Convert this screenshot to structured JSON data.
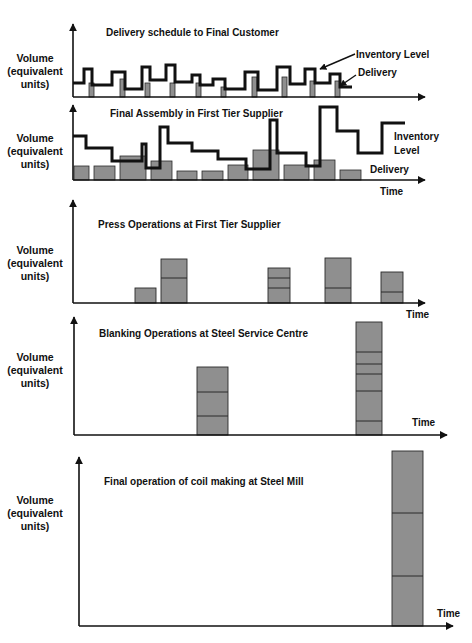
{
  "figure": {
    "axis_label_lines": [
      "Volume",
      "(equivalent",
      "units)"
    ],
    "time_label": "Time",
    "colors": {
      "bar_fill": "#8f8f8f",
      "bar_stroke": "#2a2a2a",
      "line": "#111111",
      "axis": "#111111"
    }
  },
  "chart_data": [
    {
      "type": "bar+line",
      "title": "Delivery schedule to Final Customer",
      "ylabel": "Volume (equivalent units)",
      "xlabel": "",
      "legend": [
        "Inventory Level",
        "Delivery"
      ],
      "annotations": [
        "Inventory Level",
        "Delivery"
      ],
      "layout": {
        "axis_x": 73,
        "axis_top": 22,
        "baseline": 97,
        "axis_right": 425,
        "title_x": 106,
        "title_y": 36
      },
      "delivery_bars": [
        {
          "x": 89,
          "w": 5,
          "top": 83
        },
        {
          "x": 120,
          "w": 5,
          "top": 79
        },
        {
          "x": 145,
          "w": 5,
          "top": 83
        },
        {
          "x": 170,
          "w": 5,
          "top": 83
        },
        {
          "x": 196,
          "w": 5,
          "top": 83
        },
        {
          "x": 221,
          "w": 5,
          "top": 87
        },
        {
          "x": 252,
          "w": 5,
          "top": 77
        },
        {
          "x": 282,
          "w": 5,
          "top": 77
        },
        {
          "x": 310,
          "w": 5,
          "top": 81
        },
        {
          "x": 335,
          "w": 5,
          "top": 81
        }
      ],
      "inventory_line": [
        [
          73,
          83
        ],
        [
          84,
          83
        ],
        [
          84,
          69
        ],
        [
          92,
          69
        ],
        [
          92,
          85
        ],
        [
          112,
          85
        ],
        [
          112,
          72
        ],
        [
          125,
          72
        ],
        [
          125,
          89
        ],
        [
          142,
          89
        ],
        [
          142,
          67
        ],
        [
          150,
          67
        ],
        [
          150,
          80
        ],
        [
          166,
          80
        ],
        [
          166,
          65
        ],
        [
          175,
          65
        ],
        [
          175,
          82
        ],
        [
          192,
          82
        ],
        [
          192,
          75
        ],
        [
          200,
          75
        ],
        [
          200,
          85
        ],
        [
          213,
          85
        ],
        [
          213,
          79
        ],
        [
          225,
          79
        ],
        [
          225,
          89
        ],
        [
          245,
          89
        ],
        [
          245,
          72
        ],
        [
          258,
          72
        ],
        [
          258,
          90
        ],
        [
          277,
          90
        ],
        [
          277,
          67
        ],
        [
          290,
          67
        ],
        [
          290,
          84
        ],
        [
          305,
          84
        ],
        [
          305,
          69
        ],
        [
          315,
          69
        ],
        [
          315,
          83
        ],
        [
          330,
          83
        ],
        [
          330,
          74
        ],
        [
          340,
          74
        ],
        [
          340,
          87
        ],
        [
          352,
          87
        ]
      ],
      "arrows": [
        {
          "label": "Inventory Level",
          "text_x": 356,
          "text_y": 58,
          "from": [
            355,
            54
          ],
          "to": [
            320,
            69
          ]
        },
        {
          "label": "Delivery",
          "text_x": 358,
          "text_y": 76,
          "from": [
            356,
            75
          ],
          "to": [
            340,
            86
          ]
        }
      ]
    },
    {
      "type": "bar+line",
      "title": "Final Assembly in First Tier Supplier",
      "ylabel": "Volume (equivalent units)",
      "xlabel": "Time",
      "legend": [
        "Inventory Level",
        "Delivery"
      ],
      "layout": {
        "axis_x": 73,
        "axis_top": 103,
        "baseline": 180,
        "axis_right": 425,
        "title_x": 110,
        "title_y": 117,
        "time_x": 380,
        "time_y": 195
      },
      "delivery_bars": [
        {
          "x": 74,
          "w": 15,
          "top": 166
        },
        {
          "x": 94,
          "w": 21,
          "top": 166
        },
        {
          "x": 120,
          "w": 26,
          "top": 156
        },
        {
          "x": 151,
          "w": 21,
          "top": 161
        },
        {
          "x": 177,
          "w": 20,
          "top": 171
        },
        {
          "x": 202,
          "w": 21,
          "top": 171
        },
        {
          "x": 228,
          "w": 20,
          "top": 165
        },
        {
          "x": 253,
          "w": 26,
          "top": 150
        },
        {
          "x": 284,
          "w": 25,
          "top": 165
        },
        {
          "x": 314,
          "w": 21,
          "top": 160
        },
        {
          "x": 340,
          "w": 21,
          "top": 170
        }
      ],
      "inventory_line": [
        [
          73,
          136
        ],
        [
          86,
          136
        ],
        [
          86,
          148
        ],
        [
          112,
          148
        ],
        [
          112,
          161
        ],
        [
          142,
          161
        ],
        [
          142,
          144
        ],
        [
          146,
          144
        ],
        [
          146,
          168
        ],
        [
          160,
          168
        ],
        [
          160,
          127
        ],
        [
          168,
          127
        ],
        [
          168,
          143
        ],
        [
          192,
          143
        ],
        [
          192,
          151
        ],
        [
          218,
          151
        ],
        [
          218,
          159
        ],
        [
          246,
          159
        ],
        [
          246,
          169
        ],
        [
          270,
          169
        ],
        [
          270,
          120
        ],
        [
          277,
          120
        ],
        [
          277,
          153
        ],
        [
          306,
          153
        ],
        [
          306,
          166
        ],
        [
          320,
          166
        ],
        [
          320,
          107
        ],
        [
          337,
          107
        ],
        [
          337,
          131
        ],
        [
          358,
          131
        ],
        [
          358,
          153
        ],
        [
          382,
          153
        ],
        [
          382,
          123
        ],
        [
          405,
          123
        ]
      ],
      "right_labels": [
        {
          "text": "Inventory",
          "x": 394,
          "y": 140
        },
        {
          "text": "Level",
          "x": 394,
          "y": 154
        },
        {
          "text": "Delivery",
          "x": 370,
          "y": 173
        }
      ]
    },
    {
      "type": "stacked-bar",
      "title": "Press Operations at First Tier Supplier",
      "ylabel": "Volume (equivalent units)",
      "xlabel": "Time",
      "layout": {
        "axis_x": 73,
        "axis_top": 198,
        "baseline": 303,
        "axis_right": 425,
        "title_x": 98,
        "title_y": 228,
        "time_x": 406,
        "time_y": 318
      },
      "bars": [
        {
          "x": 135,
          "w": 21,
          "top": 288,
          "dividers": []
        },
        {
          "x": 161,
          "w": 26,
          "top": 259,
          "dividers": [
            278
          ]
        },
        {
          "x": 268,
          "w": 22,
          "top": 268,
          "dividers": [
            278,
            288
          ]
        },
        {
          "x": 325,
          "w": 26,
          "top": 258,
          "dividers": [
            288
          ]
        },
        {
          "x": 381,
          "w": 22,
          "top": 272,
          "dividers": [
            292
          ]
        }
      ]
    },
    {
      "type": "stacked-bar",
      "title": "Blanking Operations at Steel Service Centre",
      "ylabel": "Volume (equivalent units)",
      "xlabel": "Time",
      "layout": {
        "axis_x": 74,
        "axis_top": 315,
        "baseline": 435,
        "axis_right": 447,
        "title_x": 99,
        "title_y": 337,
        "time_x": 412,
        "time_y": 426
      },
      "bars": [
        {
          "x": 197,
          "w": 31,
          "top": 367,
          "dividers": [
            392,
            416
          ]
        },
        {
          "x": 356,
          "w": 26,
          "top": 322,
          "dividers": [
            352,
            364,
            374,
            391,
            421
          ]
        }
      ]
    },
    {
      "type": "stacked-bar",
      "title": "Final operation of coil making at Steel Mill",
      "ylabel": "Volume (equivalent units)",
      "xlabel": "Time",
      "layout": {
        "axis_x": 79,
        "axis_top": 455,
        "baseline": 626,
        "axis_right": 453,
        "title_x": 104,
        "title_y": 485,
        "time_x": 437,
        "time_y": 617
      },
      "bars": [
        {
          "x": 392,
          "w": 31,
          "top": 451,
          "dividers": [
            513,
            576
          ]
        }
      ]
    }
  ],
  "panel_label_y": [
    62,
    142,
    254,
    361,
    504
  ]
}
